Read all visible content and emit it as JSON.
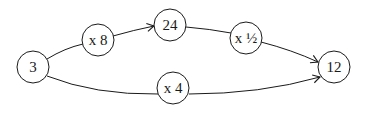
{
  "diagram": {
    "type": "flow",
    "nodes": [
      {
        "id": "n3",
        "label": "3",
        "cx": 33,
        "cy": 67,
        "r": 16
      },
      {
        "id": "x8",
        "label": "x 8",
        "cx": 98,
        "cy": 40,
        "r": 16
      },
      {
        "id": "n24",
        "label": "24",
        "cx": 170,
        "cy": 25,
        "r": 16
      },
      {
        "id": "xhalf",
        "label": "x ½",
        "cx": 246,
        "cy": 38,
        "r": 16
      },
      {
        "id": "n12",
        "label": "12",
        "cx": 334,
        "cy": 67,
        "r": 16
      },
      {
        "id": "x4",
        "label": "x 4",
        "cx": 173,
        "cy": 88,
        "r": 16
      }
    ],
    "edges": [
      {
        "from": "n3",
        "to": "x8",
        "arrow": false
      },
      {
        "from": "x8",
        "to": "n24",
        "arrow": true
      },
      {
        "from": "n24",
        "to": "xhalf",
        "arrow": false
      },
      {
        "from": "xhalf",
        "to": "n12",
        "arrow": true
      },
      {
        "from": "n3",
        "to": "x4",
        "arrow": false
      },
      {
        "from": "x4",
        "to": "n12",
        "arrow": true
      }
    ],
    "colors": {
      "stroke": "#1a1a1a",
      "fill": "#ffffff"
    }
  }
}
